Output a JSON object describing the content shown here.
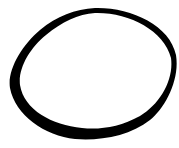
{
  "image": {
    "subject": "hand-drawn brush-stroke ellipse (enso-like ring)",
    "background_color": "#ffffff",
    "stroke_color": "#000000"
  }
}
